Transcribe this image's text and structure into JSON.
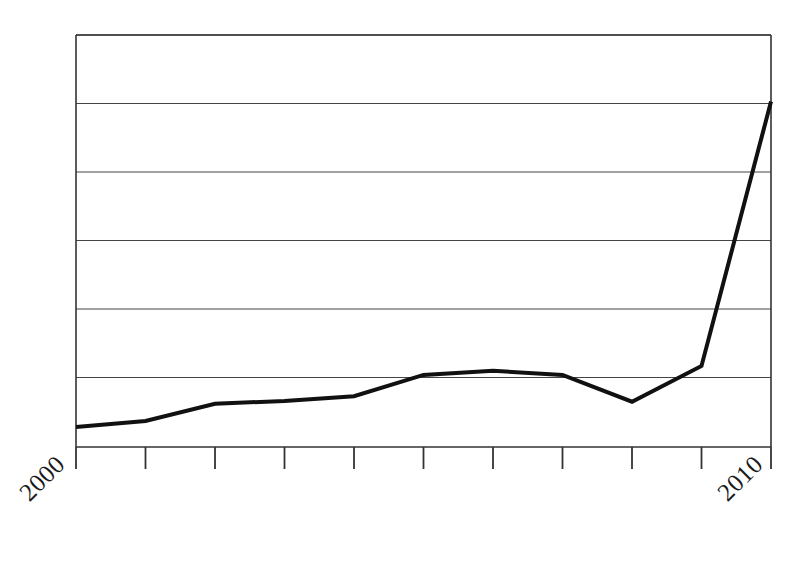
{
  "figure": {
    "width": 811,
    "height": 567,
    "background_color": "#ffffff"
  },
  "chart_data": {
    "type": "line",
    "title": "",
    "subtitle": "",
    "xlabel": "",
    "ylabel": "",
    "x": [
      2000,
      2001,
      2002,
      2003,
      2004,
      2005,
      2006,
      2007,
      2008,
      2009,
      2010
    ],
    "categories": [
      "2000",
      "2001",
      "2002",
      "2003",
      "2004",
      "2005",
      "2006",
      "2007",
      "2008",
      "2009",
      "2010"
    ],
    "values": [
      0.29,
      0.38,
      0.63,
      0.67,
      0.74,
      1.05,
      1.11,
      1.05,
      0.66,
      1.18,
      5.03
    ],
    "series": [
      {
        "name": "series-1",
        "values": [
          0.29,
          0.38,
          0.63,
          0.67,
          0.74,
          1.05,
          1.11,
          1.05,
          0.66,
          1.18,
          5.03
        ],
        "color": "#111111",
        "line_width": 4
      }
    ],
    "xlim": [
      2000,
      2010
    ],
    "ylim": [
      0,
      6
    ],
    "xticks": [
      2000,
      2001,
      2002,
      2003,
      2004,
      2005,
      2006,
      2007,
      2008,
      2009,
      2010
    ],
    "xtick_labels_visible": [
      "2000",
      "2010"
    ],
    "xtick_label_rotation": 45,
    "yticks": [
      0,
      1,
      2,
      3,
      4,
      5,
      6
    ],
    "ytick_labels": [],
    "grid": {
      "horizontal": true,
      "vertical": false,
      "color": "#444444",
      "line_width": 1
    },
    "legend": {
      "visible": false,
      "position": "none",
      "entries": []
    },
    "annotations": [],
    "spines": {
      "left": true,
      "bottom": true,
      "top": true,
      "right": true,
      "color": "#333333"
    }
  },
  "axis_labels": {
    "x_start": "2000",
    "x_end": "2010"
  },
  "geometry": {
    "plot_left": 76,
    "plot_right": 771,
    "plot_top": 35,
    "plot_bottom": 447,
    "gridline_y": [
      35,
      103.5,
      172,
      240.5,
      309,
      377.5
    ],
    "tick_x": [
      76,
      145.5,
      215,
      284.5,
      354,
      423.5,
      493,
      562.5,
      632,
      701.5,
      771
    ],
    "tick_length": 22,
    "point_y": [
      427,
      421,
      404,
      401,
      396,
      375,
      371,
      375,
      402,
      366,
      102
    ]
  }
}
